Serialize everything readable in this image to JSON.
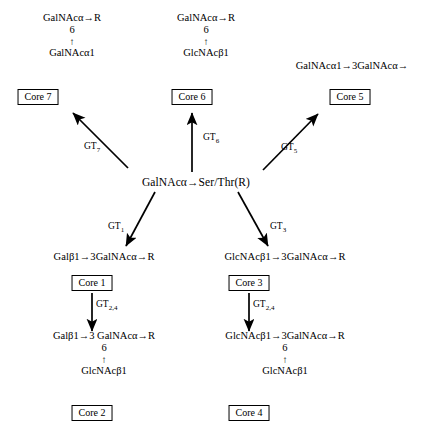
{
  "diagram": {
    "hub": {
      "label": "GalNAcα→Ser/Thr(R)"
    },
    "structures": {
      "core7_top": {
        "line1": "GalNAcα→R",
        "line2": "6",
        "line3": "↑",
        "line4": "GalNAcα1"
      },
      "core6_top": {
        "line1": "GalNAcα→R",
        "line2": "6",
        "line3": "↑",
        "line4": "GlcNAcβ1"
      },
      "core5_top": {
        "line1": "GalNAcα1→3GalNAcα→"
      },
      "core1_struct": "Galβ1→3GalNAcα→R",
      "core3_struct": "GlcNAcβ1→3GalNAcα→R",
      "core2_struct": {
        "line1": "Galβ1→3 GalNAcα→R",
        "line2": "6",
        "line3": "↑",
        "line4": "GlcNAcβ1"
      },
      "core4_struct": {
        "line1": "GlcNAcβ1→3GalNAcα→R",
        "line2": "6",
        "line3": "↑",
        "line4": "GlcNAcβ1"
      }
    },
    "boxes": {
      "core7": "Core 7",
      "core6": "Core 6",
      "core5": "Core 5",
      "core1": "Core 1",
      "core3": "Core 3",
      "core2": "Core 2",
      "core4": "Core 4"
    },
    "enzymes": {
      "gt7": "GT",
      "gt7_sub": "7",
      "gt6": "GT",
      "gt6_sub": "6",
      "gt5": "GT",
      "gt5_sub": "5",
      "gt1": "GT",
      "gt1_sub": "1",
      "gt3": "GT",
      "gt3_sub": "3",
      "gt24_left": "GT",
      "gt24_left_sub": "2,4",
      "gt24_right": "GT",
      "gt24_right_sub": "2,4"
    },
    "colors": {
      "ink": "#000000",
      "background": "#ffffff"
    }
  }
}
